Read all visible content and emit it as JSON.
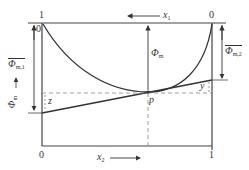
{
  "diagram": {
    "type": "phase-diagram-mixing-property",
    "top_axis": {
      "left_tick": "1",
      "right_tick": "0",
      "variable": "x",
      "variable_sub": "1",
      "direction": "left"
    },
    "bottom_axis": {
      "left_tick": "0",
      "right_tick": "1",
      "variable": "x",
      "variable_sub": "2",
      "direction": "right"
    },
    "inner_top_left_tick": "0",
    "labels": {
      "phi_m": {
        "symbol": "Φ",
        "sub": "m"
      },
      "phi_m1_bar": {
        "symbol": "Φ",
        "sub": "m,1"
      },
      "phi_m2_bar": {
        "symbol": "Φ",
        "sub": "m,2"
      },
      "phi_m_left": {
        "symbol": "Φ",
        "sub": "m"
      },
      "point_p": "p",
      "z": "z",
      "y": "y"
    },
    "colors": {
      "line": "#333333",
      "dashed": "#888888",
      "background": "#ffffff"
    }
  }
}
